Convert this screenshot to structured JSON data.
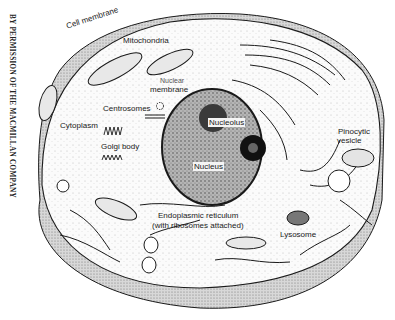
{
  "figure": {
    "credit": "BY PERMISSION OF THE MACMILLAN COMPANY",
    "colors": {
      "ink": "#1a1a1a",
      "paper": "#ffffff",
      "stipple": "#555555",
      "nucleus_fill": "#8a8a8a"
    }
  },
  "labels": {
    "cell_membrane": "Cell membrane",
    "mitochondria": "Mitochondria",
    "nuclear_membrane_1": "Nuclear",
    "nuclear_membrane_2": "membrane",
    "centrosomes": "Centrosomes",
    "cytoplasm": "Cytoplasm",
    "golgi_body": "Golgi body",
    "nucleolus": "Nucleolus",
    "nucleus": "Nucleus",
    "pinocytic_vesicle_1": "Pinocytic",
    "pinocytic_vesicle_2": "vesicle",
    "er_1": "Endoplasmic reticulum",
    "er_2": "(with ribosomes attached)",
    "lysosome": "Lysosome"
  }
}
